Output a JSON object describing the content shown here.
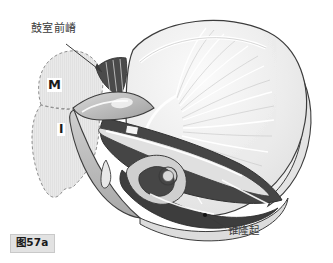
{
  "figure": {
    "caption": "图57a",
    "width": 333,
    "height": 263,
    "background_color": "#ffffff"
  },
  "labels": {
    "anterior_tympanic_crest": "鼓室前嵴",
    "pyramidal_eminence": "锥隆起"
  },
  "region_markers": {
    "m": "M",
    "i": "I"
  },
  "colors": {
    "outline": "#3c3c3c",
    "membrane_light": "#e8e8e8",
    "membrane_highlight": "#fafafa",
    "bone_mid_gray": "#b8b8b8",
    "bone_light_gray": "#d4d4d4",
    "cavity_dark": "#4a4a4a",
    "cavity_darker": "#3a3a3a",
    "hatch_region_fill": "#e6e6e6",
    "hatch_dash_stroke": "#8a8a8a",
    "label_text": "#3a3a3a",
    "caption_background": "#e2e2e2",
    "caption_border": "#c9c9c9",
    "leader_line": "#3a3a3a",
    "marker_dot": "#141414"
  },
  "leader_lines": {
    "anterior_crest": {
      "from_x": 66,
      "from_y": 44,
      "to_x": 102,
      "to_y": 72
    },
    "pyramidal_eminence": {
      "from_x": 226,
      "from_y": 228,
      "to_x": 206,
      "to_y": 216
    }
  },
  "marker_dot": {
    "x": 205,
    "y": 215,
    "radius": 2.1
  }
}
